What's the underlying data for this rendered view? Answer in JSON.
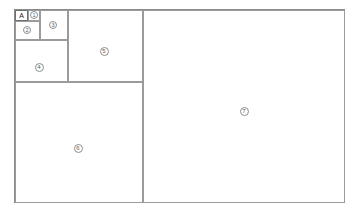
{
  "diagram": {
    "type": "nested-partition-frame",
    "canvas": {
      "width": 359,
      "height": 215,
      "background": "#ffffff"
    },
    "stroke_color": "#9b9b9b",
    "outer_stroke_color": "#8a8a8a",
    "marker_text_color": "#5d5d5d"
  },
  "tag": {
    "label": "A",
    "box": {
      "x": 15,
      "y": 10,
      "width": 13,
      "height": 11
    }
  },
  "panels": [
    {
      "id": "panel-1",
      "marker": "1",
      "label": "1",
      "rect": {
        "x": 28,
        "y": 10,
        "width": 12,
        "height": 11
      },
      "marker_pos": {
        "x": 34,
        "y": 15
      }
    },
    {
      "id": "panel-2",
      "marker": "2",
      "label": "2",
      "rect": {
        "x": 15,
        "y": 21,
        "width": 25,
        "height": 19
      },
      "marker_pos": {
        "x": 27,
        "y": 30
      }
    },
    {
      "id": "panel-3",
      "marker": "3",
      "label": "3",
      "rect": {
        "x": 40,
        "y": 10,
        "width": 28,
        "height": 30
      },
      "marker_pos": {
        "x": 53,
        "y": 25
      }
    },
    {
      "id": "panel-4",
      "marker": "4",
      "label": "4",
      "rect": {
        "x": 15,
        "y": 40,
        "width": 53,
        "height": 42
      },
      "marker_pos": {
        "x": 39,
        "y": 67
      }
    },
    {
      "id": "panel-5",
      "marker": "5",
      "label": "5",
      "rect": {
        "x": 68,
        "y": 10,
        "width": 75,
        "height": 72
      },
      "marker_pos": {
        "x": 104,
        "y": 51
      }
    },
    {
      "id": "panel-6",
      "marker": "6",
      "label": "6",
      "rect": {
        "x": 15,
        "y": 82,
        "width": 128,
        "height": 121
      },
      "marker_pos": {
        "x": 78,
        "y": 148
      }
    },
    {
      "id": "panel-7",
      "marker": "7",
      "label": "7",
      "rect": {
        "x": 143,
        "y": 10,
        "width": 202,
        "height": 193
      },
      "marker_pos": {
        "x": 244,
        "y": 111
      }
    }
  ],
  "outer": {
    "rect": {
      "x": 14,
      "y": 9,
      "width": 331,
      "height": 194
    }
  }
}
